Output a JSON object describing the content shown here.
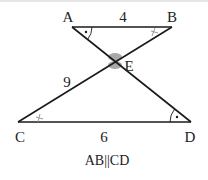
{
  "diagram": {
    "points": {
      "A": {
        "label": "A",
        "x": 72,
        "y": 27
      },
      "B": {
        "label": "B",
        "x": 172,
        "y": 27
      },
      "C": {
        "label": "C",
        "x": 18,
        "y": 122
      },
      "D": {
        "label": "D",
        "x": 191,
        "y": 122
      },
      "E": {
        "label": "E",
        "x": 115,
        "y": 61
      }
    },
    "segment_labels": {
      "AB": "4",
      "CE": "9",
      "CD": "6"
    },
    "caption": "AB||CD",
    "colors": {
      "line": "#1a1a1a",
      "vertical_angle_marker": "#a8a8a8",
      "tick_marker": "#999999"
    }
  }
}
